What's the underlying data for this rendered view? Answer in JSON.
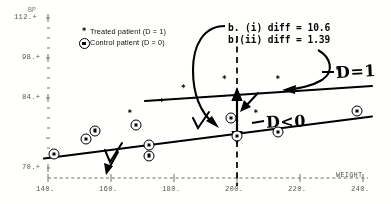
{
  "figure": {
    "kind": "scatter-with-regression-lines",
    "background": "#fdfdfb",
    "ink": "#000000"
  },
  "axes": {
    "y": {
      "title": "BP",
      "labels": [
        "112.+",
        "98.+",
        "84.+",
        "70.+"
      ],
      "tick_values": [
        112,
        98,
        84,
        70
      ],
      "min": 70,
      "max": 112
    },
    "x": {
      "title": "WEIGHT",
      "labels": [
        "140.",
        "160.",
        "180.",
        "200.",
        "220.",
        "240."
      ],
      "tick_values": [
        140,
        160,
        180,
        200,
        220,
        240
      ],
      "min": 140,
      "max": 240
    }
  },
  "legend": {
    "items": [
      {
        "marker": "asterisk-marker",
        "symbol": "*",
        "label": "Treated patient (D = 1)"
      },
      {
        "marker": "circled-dot-marker",
        "symbol": "⊛",
        "label": "Control patient (D = 0)"
      }
    ]
  },
  "annotations": {
    "diff_i": "b. (i) diff = 10.6",
    "diff_ii": "b.(ii) diff = 1.39",
    "line_upper_label": "D=1",
    "line_lower_label": "D<0"
  },
  "chart_data": {
    "type": "scatter",
    "title": "",
    "xlabel": "WEIGHT",
    "ylabel": "BP",
    "xlim": [
      140,
      240
    ],
    "ylim": [
      70,
      112
    ],
    "grid": false,
    "legend_position": "top-left",
    "series": [
      {
        "name": "Treated patient (D = 1)",
        "marker": "*",
        "points": [
          {
            "x": 183,
            "y": 93
          },
          {
            "x": 196,
            "y": 95.5
          },
          {
            "x": 213,
            "y": 95.5
          },
          {
            "x": 206,
            "y": 86
          },
          {
            "x": 232,
            "y": 98
          },
          {
            "x": 176,
            "y": 89
          },
          {
            "x": 166,
            "y": 86
          }
        ]
      },
      {
        "name": "Control patient (D = 0)",
        "marker": "⊛",
        "points": [
          {
            "x": 142,
            "y": 74
          },
          {
            "x": 152,
            "y": 78
          },
          {
            "x": 155,
            "y": 80.5
          },
          {
            "x": 168,
            "y": 82
          },
          {
            "x": 172,
            "y": 76.5
          },
          {
            "x": 172,
            "y": 73.5
          },
          {
            "x": 198,
            "y": 84
          },
          {
            "x": 200,
            "y": 79
          },
          {
            "x": 213,
            "y": 80
          },
          {
            "x": 238,
            "y": 86
          }
        ]
      }
    ],
    "lines": [
      {
        "name": "regression-line-treated",
        "label": "D=1",
        "x": [
          178,
          244
        ],
        "y": [
          90.5,
          97.5
        ]
      },
      {
        "name": "regression-line-control",
        "label": "D<0",
        "x": [
          140,
          244
        ],
        "y": [
          76.0,
          88.0
        ]
      }
    ],
    "markers": {
      "vertical_reference_x": 200,
      "double_arrow": {
        "x": 200,
        "y_from": 82.5,
        "y_to": 92.5
      }
    }
  }
}
